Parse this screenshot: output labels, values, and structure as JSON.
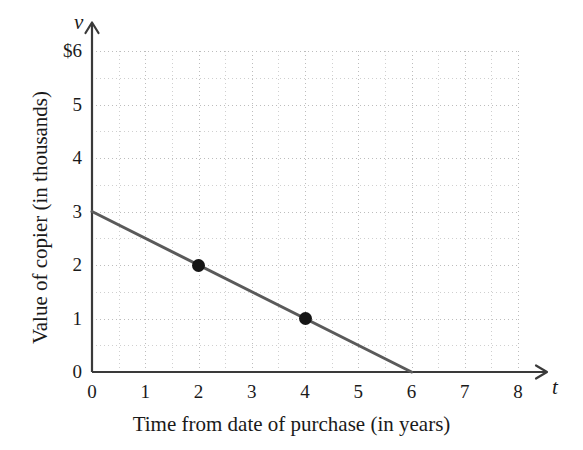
{
  "chart_data": {
    "type": "line",
    "title": "",
    "subtitle": "",
    "xlabel": "Time from date of purchase (in years)",
    "ylabel": "Value of copier (in thousands)",
    "x_variable": "t",
    "y_variable": "v",
    "xlim": [
      0,
      8
    ],
    "ylim": [
      0,
      6
    ],
    "grid": true,
    "grid_major_step": 1,
    "grid_minor_step": 0.5,
    "legend": "none",
    "x_tick_labels": [
      "0",
      "1",
      "2",
      "3",
      "4",
      "5",
      "6",
      "7",
      "8"
    ],
    "x_tick_values": [
      0,
      1,
      2,
      3,
      4,
      5,
      6,
      7,
      8
    ],
    "y_tick_labels": [
      "0",
      "1",
      "2",
      "3",
      "4",
      "5",
      "$6"
    ],
    "y_tick_values": [
      0,
      1,
      2,
      3,
      4,
      5,
      6
    ],
    "series": [
      {
        "name": "Value of copier",
        "type": "line",
        "color": "#5a5a5a",
        "line_width": 3,
        "x": [
          0,
          6
        ],
        "values": [
          3,
          0
        ],
        "equation": "v = 3 - 0.5t",
        "slope": -0.5,
        "intercept": 3
      }
    ],
    "marked_points": [
      {
        "label": "(2, 2)",
        "x": 2,
        "y": 2,
        "color": "#151515"
      },
      {
        "label": "(4, 1)",
        "x": 4,
        "y": 1,
        "color": "#151515"
      }
    ],
    "annotations": [],
    "colors": {
      "line": "#5a5a5a",
      "axis": "#3a3a3a",
      "grid": "#bdbdbd",
      "point": "#151515",
      "text": "#1a1a1a",
      "background": "#ffffff"
    }
  }
}
